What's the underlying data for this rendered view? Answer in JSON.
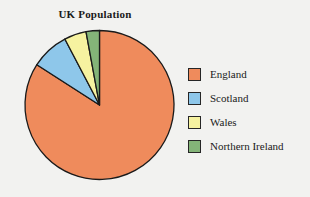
{
  "chart_data": {
    "type": "pie",
    "title": "UK Population",
    "categories": [
      "England",
      "Scotland",
      "Wales",
      "Northern Ireland"
    ],
    "values": [
      84.1,
      8.2,
      4.8,
      2.9
    ],
    "unit": "percent",
    "colors": [
      "#ef8b5c",
      "#8ec7ea",
      "#f6f2a0",
      "#84b478"
    ],
    "slice_border_color": "#1a1a1a",
    "start_angle_deg": 0,
    "direction": "clockwise",
    "legend": {
      "position": "right",
      "entries": [
        {
          "label": "England",
          "color": "#ef8b5c"
        },
        {
          "label": "Scotland",
          "color": "#8ec7ea"
        },
        {
          "label": "Wales",
          "color": "#f6f2a0"
        },
        {
          "label": "Northern Ireland",
          "color": "#84b478"
        }
      ]
    },
    "xlabel": "",
    "ylabel": "",
    "grid": false
  },
  "background_color": "#f2f2f0"
}
